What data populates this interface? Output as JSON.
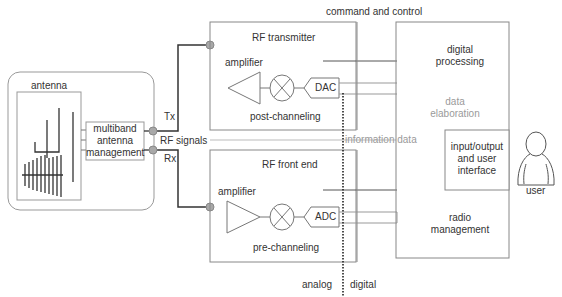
{
  "diagram": {
    "colors": {
      "line": "#555555",
      "thick_line": "#333333",
      "box_border": "#888888",
      "connector": "#9a9a9a",
      "muted_text": "#9a9a9a"
    },
    "antenna_group": {
      "antenna_label": "antenna",
      "multiband_label_1": "multiband",
      "multiband_label_2": "antenna",
      "multiband_label_3": "management"
    },
    "links": {
      "tx": "Tx",
      "rx": "Rx",
      "rf_signals": "RF signals"
    },
    "transmitter": {
      "title": "RF transmitter",
      "amplifier": "amplifier",
      "converter": "DAC",
      "stage": "post-channeling"
    },
    "front_end": {
      "title": "RF front end",
      "amplifier": "amplifier",
      "converter": "ADC",
      "stage": "pre-channeling"
    },
    "buses": {
      "command_control": "command and control",
      "information_data": "information data"
    },
    "boundary": {
      "analog": "analog",
      "digital": "digital"
    },
    "digital_block": {
      "processing_1": "digital",
      "processing_2": "processing",
      "elaboration_1": "data",
      "elaboration_2": "elaboration",
      "io_1": "input/output",
      "io_2": "and user",
      "io_3": "interface",
      "radio_1": "radio",
      "radio_2": "management"
    },
    "user": {
      "label": "user",
      "icon": "user-icon"
    }
  }
}
